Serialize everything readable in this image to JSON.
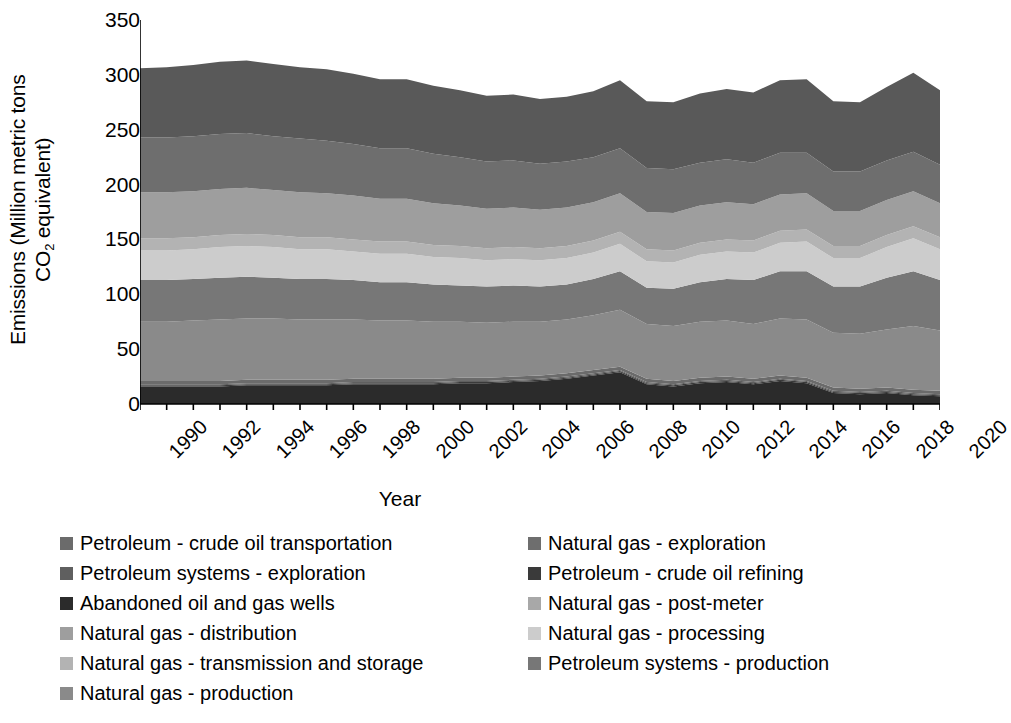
{
  "chart_data": {
    "type": "area",
    "stacked": true,
    "title": "",
    "xlabel": "Year",
    "ylabel": "Emissions (Million metric tons CO2 equivalent)",
    "ylabel_line1": "Emissions (Million metric tons",
    "ylabel_line2_pre": "CO",
    "ylabel_line2_sub": "2",
    "ylabel_line2_post": " equivalent)",
    "ylim": [
      0,
      350
    ],
    "yticks": [
      0,
      50,
      100,
      150,
      200,
      250,
      300,
      350
    ],
    "xlim": [
      1990,
      2020
    ],
    "xticks": [
      1990,
      1992,
      1994,
      1996,
      1998,
      2000,
      2002,
      2004,
      2006,
      2008,
      2010,
      2012,
      2014,
      2016,
      2018,
      2020
    ],
    "grid": false,
    "legend_position": "below",
    "legend_columns": 2,
    "x": [
      1990,
      1991,
      1992,
      1993,
      1994,
      1995,
      1996,
      1997,
      1998,
      1999,
      2000,
      2001,
      2002,
      2003,
      2004,
      2005,
      2006,
      2007,
      2008,
      2009,
      2010,
      2011,
      2012,
      2013,
      2014,
      2015,
      2016,
      2017,
      2018,
      2019,
      2020
    ],
    "series": [
      {
        "name": "Natural gas - production",
        "color": "#8a8a8a",
        "values": [
          54,
          54,
          55,
          56,
          56,
          56,
          55,
          55,
          54,
          53,
          53,
          52,
          51,
          50,
          50,
          49,
          49,
          50,
          52,
          50,
          50,
          51,
          51,
          50,
          52,
          53,
          50,
          50,
          53,
          58,
          55
        ]
      },
      {
        "name": "Petroleum systems - production",
        "color": "#777777",
        "values": [
          38,
          38,
          38,
          38,
          38,
          37,
          37,
          37,
          36,
          35,
          35,
          34,
          33,
          33,
          33,
          32,
          32,
          33,
          35,
          33,
          34,
          36,
          38,
          40,
          43,
          44,
          42,
          43,
          47,
          50,
          46
        ]
      },
      {
        "name": "Natural gas - processing",
        "color": "#cccccc",
        "values": [
          27,
          27,
          27,
          28,
          28,
          28,
          27,
          27,
          26,
          26,
          26,
          25,
          25,
          24,
          24,
          24,
          24,
          24,
          25,
          24,
          24,
          25,
          25,
          25,
          26,
          27,
          26,
          26,
          28,
          30,
          28
        ]
      },
      {
        "name": "Natural gas - post-meter",
        "color": "#b3b3b3",
        "values": [
          11,
          11,
          11,
          11,
          11,
          11,
          11,
          11,
          11,
          11,
          11,
          11,
          11,
          11,
          11,
          11,
          11,
          11,
          11,
          11,
          11,
          11,
          11,
          11,
          11,
          11,
          11,
          11,
          11,
          11,
          11
        ]
      },
      {
        "name": "Natural gas - transmission and storage",
        "color": "#9e9e9e",
        "values": [
          42,
          42,
          42,
          42,
          42,
          41,
          41,
          40,
          40,
          39,
          39,
          38,
          37,
          36,
          36,
          35,
          35,
          35,
          35,
          34,
          34,
          34,
          34,
          33,
          33,
          33,
          32,
          32,
          32,
          32,
          31
        ]
      },
      {
        "name": "Natural gas - distribution",
        "color": "#6e6e6e",
        "values": [
          50,
          50,
          50,
          50,
          50,
          49,
          49,
          48,
          47,
          46,
          46,
          45,
          44,
          43,
          43,
          42,
          42,
          41,
          41,
          40,
          40,
          39,
          39,
          38,
          38,
          37,
          36,
          36,
          36,
          36,
          35
        ]
      },
      {
        "name": "Natural gas - exploration",
        "color": "#595959",
        "values": [
          63,
          64,
          65,
          66,
          66,
          66,
          65,
          65,
          64,
          63,
          63,
          62,
          61,
          60,
          60,
          59,
          59,
          60,
          62,
          61,
          61,
          63,
          64,
          64,
          66,
          67,
          64,
          63,
          67,
          72,
          68
        ]
      },
      {
        "name": "Petroleum - crude oil transportation",
        "color": "#6b6b6b",
        "values": [
          3,
          3,
          3,
          3,
          3,
          3,
          3,
          3,
          3,
          3,
          3,
          3,
          3,
          3,
          3,
          3,
          3,
          3,
          3,
          3,
          3,
          3,
          3,
          3,
          3,
          3,
          3,
          3,
          3,
          3,
          3
        ]
      },
      {
        "name": "Petroleum systems - exploration",
        "color": "#5f5f5f",
        "values": [
          1,
          1,
          1,
          1,
          1,
          1,
          1,
          1,
          1,
          1,
          1,
          1,
          1,
          1,
          1,
          1,
          1,
          1,
          1,
          1,
          1,
          1,
          1,
          1,
          1,
          1,
          1,
          1,
          1,
          1,
          1
        ]
      },
      {
        "name": "Petroleum - crude oil refining",
        "color": "#3a3a3a",
        "values": [
          1,
          1,
          1,
          1,
          1,
          1,
          1,
          1,
          1,
          1,
          1,
          1,
          1,
          1,
          1,
          1,
          1,
          1,
          1,
          1,
          1,
          1,
          1,
          1,
          1,
          1,
          1,
          1,
          1,
          1,
          1
        ]
      },
      {
        "name": "Abandoned oil and gas wells",
        "color": "#2b2b2b",
        "values": [
          16,
          16,
          16,
          16,
          17,
          17,
          17,
          17,
          18,
          18,
          18,
          18,
          19,
          19,
          20,
          21,
          23,
          26,
          29,
          18,
          16,
          19,
          20,
          18,
          21,
          19,
          10,
          9,
          10,
          8,
          7
        ]
      }
    ],
    "stack_order_bottom_to_top": [
      "Abandoned oil and gas wells",
      "Petroleum - crude oil refining",
      "Petroleum systems - exploration",
      "Petroleum - crude oil transportation",
      "Natural gas - production",
      "Petroleum systems - production",
      "Natural gas - processing",
      "Natural gas - post-meter",
      "Natural gas - transmission and storage",
      "Natural gas - distribution",
      "Natural gas - exploration"
    ]
  },
  "legend": {
    "left_column": [
      {
        "label": "Petroleum - crude oil transportation",
        "color": "#6b6b6b"
      },
      {
        "label": "Petroleum systems - exploration",
        "color": "#5f5f5f"
      },
      {
        "label": "Abandoned oil and gas wells",
        "color": "#2b2b2b"
      },
      {
        "label": "Natural gas - distribution",
        "color": "#9e9e9e"
      },
      {
        "label": "Natural gas - transmission and storage",
        "color": "#b3b3b3"
      },
      {
        "label": "Natural gas - production",
        "color": "#8a8a8a"
      }
    ],
    "right_column": [
      {
        "label": "Natural gas - exploration",
        "color": "#6e6e6e"
      },
      {
        "label": "Petroleum - crude oil refining",
        "color": "#3a3a3a"
      },
      {
        "label": "Natural gas - post-meter",
        "color": "#a8a8a8"
      },
      {
        "label": "Natural gas - processing",
        "color": "#cccccc"
      },
      {
        "label": "Petroleum systems - production",
        "color": "#777777"
      }
    ]
  },
  "axis": {
    "y_title_line1": "Emissions (Million metric tons",
    "y_title_co": "CO",
    "y_title_sub": "2",
    "y_title_tail": " equivalent)",
    "x_title": "Year"
  }
}
